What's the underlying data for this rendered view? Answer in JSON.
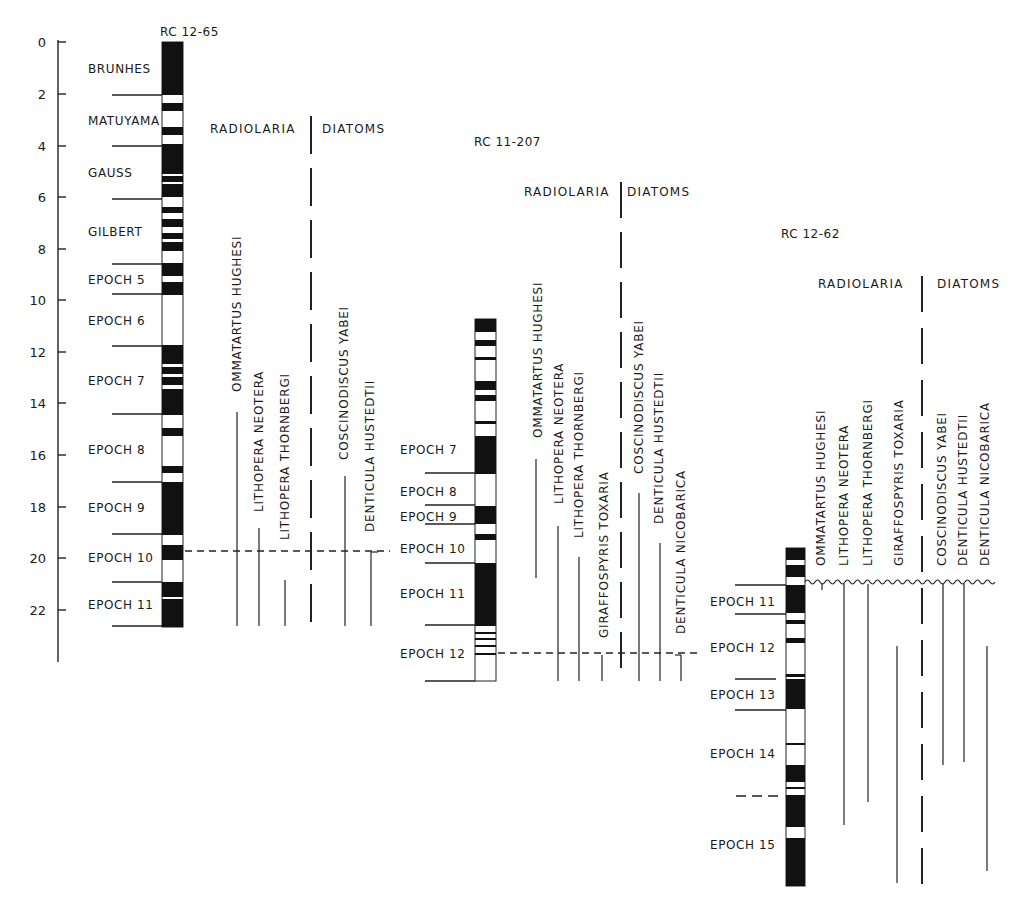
{
  "figure": {
    "axis": {
      "ticks": [
        "0",
        "2",
        "4",
        "6",
        "8",
        "10",
        "12",
        "14",
        "16",
        "18",
        "20",
        "22"
      ],
      "tick_values": [
        0,
        2,
        4,
        6,
        8,
        10,
        12,
        14,
        16,
        18,
        20,
        22
      ]
    },
    "group_labels": {
      "radiolaria": "RADIOLARIA",
      "diatoms": "DIATOMS"
    },
    "cores": [
      {
        "id": "RC 12-65",
        "title": "RC 12-65",
        "zones": [
          "BRUNHES",
          "MATUYAMA",
          "GAUSS",
          "GILBERT",
          "EPOCH 5",
          "EPOCH 6",
          "EPOCH 7",
          "EPOCH 8",
          "EPOCH 9",
          "EPOCH 10",
          "EPOCH 11"
        ],
        "taxa": {
          "radiolaria": [
            "OMMATARTUS HUGHESI",
            "LITHOPERA NEOTERA",
            "LITHOPERA THORNBERGI"
          ],
          "diatoms": [
            "COSCINODISCUS YABEI",
            "DENTICULA HUSTEDTII"
          ]
        }
      },
      {
        "id": "RC 11-207",
        "title": "RC 11-207",
        "zones": [
          "EPOCH 7",
          "EPOCH 8",
          "EPOCH 9",
          "EPOCH 10",
          "EPOCH 11",
          "EPOCH 12"
        ],
        "taxa": {
          "radiolaria": [
            "OMMATARTUS HUGHESI",
            "LITHOPERA NEOTERA",
            "LITHOPERA THORNBERGI",
            "GIRAFFOSPYRIS TOXARIA"
          ],
          "diatoms": [
            "COSCINODISCUS YABEI",
            "DENTICULA HUSTEDTII",
            "DENTICULA NICOBARICA"
          ]
        }
      },
      {
        "id": "RC 12-62",
        "title": "RC 12-62",
        "zones": [
          "EPOCH 11",
          "EPOCH 12",
          "EPOCH 13",
          "EPOCH 14",
          "EPOCH 15"
        ],
        "taxa": {
          "radiolaria": [
            "OMMATARTUS HUGHESI",
            "LITHOPERA NEOTERA",
            "LITHOPERA THORNBERGI",
            "GIRAFFOSPYRIS TOXARIA"
          ],
          "diatoms": [
            "COSCINODISCUS YABEI",
            "DENTICULA HUSTEDTII",
            "DENTICULA NICOBARICA"
          ]
        }
      }
    ]
  }
}
